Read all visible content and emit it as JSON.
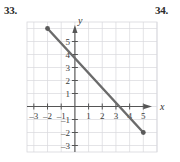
{
  "figure": {
    "problem_left": "33.",
    "problem_right": "34."
  },
  "chart_data": {
    "type": "line",
    "title": "",
    "xlabel": "x",
    "ylabel": "y",
    "xlim": [
      -3.5,
      6
    ],
    "ylim": [
      -3.5,
      6.5
    ],
    "grid": true,
    "grid_color": "#d8d8dc",
    "axis_color": "#555555",
    "line_color": "#6b6b6b",
    "point_color": "#5a5a5a",
    "legend": "none",
    "x_tick_labels": [
      "-3",
      "-2",
      "-1",
      "1",
      "2",
      "3",
      "4",
      "5"
    ],
    "x_tick_values": [
      -3,
      -2,
      -1,
      1,
      2,
      3,
      4,
      5
    ],
    "y_tick_labels": [
      "5",
      "4",
      "3",
      "2",
      "1",
      "-1",
      "-2",
      "-3"
    ],
    "y_tick_values": [
      5,
      4,
      3,
      2,
      1,
      -1,
      -2,
      -3
    ],
    "series": [
      {
        "name": "segment",
        "kind": "segment-with-endpoints",
        "x": [
          -2,
          5
        ],
        "y": [
          6,
          -2
        ],
        "endpoints_filled": true,
        "y_intercept": 4,
        "x_intercept": 4,
        "slope": -1.1428571428571428
      }
    ],
    "annotations": []
  }
}
